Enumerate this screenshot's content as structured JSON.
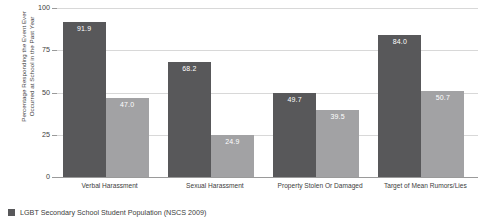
{
  "chart_data": {
    "type": "bar",
    "title": "",
    "xlabel": "",
    "ylabel": "Percentage Responding the Event Ever\nOccurred at School in the Past Year",
    "ylim": [
      0,
      100
    ],
    "yticks": [
      "0",
      "25",
      "50",
      "75",
      "100"
    ],
    "grid": true,
    "legend_position": "bottom-left",
    "categories": [
      "Verbal Harassment",
      "Sexual Harassment",
      "Property Stolen Or Damaged",
      "Target of Mean Rumors/Lies"
    ],
    "series": [
      {
        "name": "LGBT Secondary School Student Population (NSCS 2009)",
        "color": "#58585a",
        "values": [
          91.9,
          68.2,
          49.7,
          84.0
        ],
        "labels": [
          "91.9",
          "68.2",
          "49.7",
          "84.0"
        ]
      },
      {
        "name": "",
        "color": "#a2a2a4",
        "values": [
          47.0,
          24.9,
          39.5,
          50.7
        ],
        "labels": [
          "47.0",
          "24.9",
          "39.5",
          "50.7"
        ]
      }
    ]
  },
  "legend": {
    "entries": [
      {
        "label": "LGBT Secondary School Student Population (NSCS 2009)",
        "color": "#58585a"
      }
    ]
  }
}
